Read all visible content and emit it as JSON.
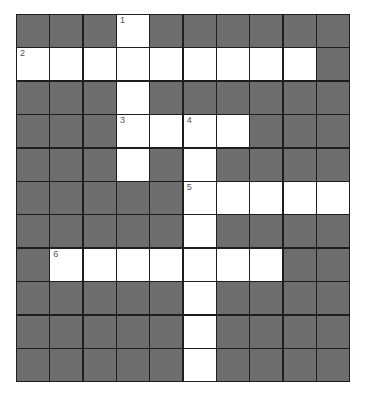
{
  "puzzle": {
    "rows": 11,
    "cols": 10,
    "colors": {
      "block": "#6e6e6e",
      "open": "#ffffff",
      "line": "#1e1e1e"
    },
    "layout": [
      "###.######",
      ".........#",
      "###.######",
      "###....###",
      "###.#.####",
      "#####.....",
      "#####.####",
      "#.......##",
      "#####.####",
      "#####.####",
      "#####.####"
    ],
    "numbers": [
      {
        "row": 0,
        "col": 3,
        "label": "1"
      },
      {
        "row": 1,
        "col": 0,
        "label": "2"
      },
      {
        "row": 3,
        "col": 3,
        "label": "3"
      },
      {
        "row": 3,
        "col": 5,
        "label": "4"
      },
      {
        "row": 5,
        "col": 5,
        "label": "5"
      },
      {
        "row": 7,
        "col": 1,
        "label": "6"
      }
    ]
  }
}
